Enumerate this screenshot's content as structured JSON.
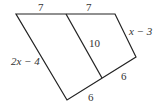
{
  "diagram": {
    "type": "quadrilateral-with-midsegment",
    "labels": {
      "top_left_segment": "7",
      "top_right_segment": "7",
      "right_side": "x − 3",
      "left_side": "2x − 4",
      "middle_segment": "10",
      "bottom_right_segment": "6",
      "bottom_left_segment": "6"
    },
    "colors": {
      "stroke": "#222222",
      "text": "#333333"
    }
  }
}
